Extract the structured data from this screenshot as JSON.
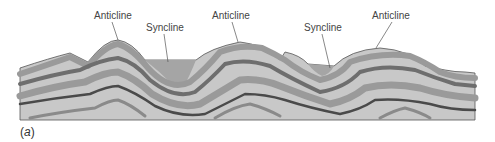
{
  "diagram": {
    "caption_open": "(",
    "caption_letter": "a",
    "caption_close": ")",
    "labels": [
      {
        "text": "Anticline",
        "x": 94,
        "y": 10
      },
      {
        "text": "Syncline",
        "x": 146,
        "y": 22
      },
      {
        "text": "Anticline",
        "x": 212,
        "y": 10
      },
      {
        "text": "Syncline",
        "x": 304,
        "y": 22
      },
      {
        "text": "Anticline",
        "x": 372,
        "y": 10
      }
    ],
    "colors": {
      "light_layer": "#c8c8c8",
      "medium_layer": "#9a9a9a",
      "dark_layer": "#6e6e6e",
      "darkest_line": "#4a4a4a",
      "syncline_fill": "#a5a5a5",
      "outline": "#555555",
      "leader_line": "#555555"
    }
  }
}
